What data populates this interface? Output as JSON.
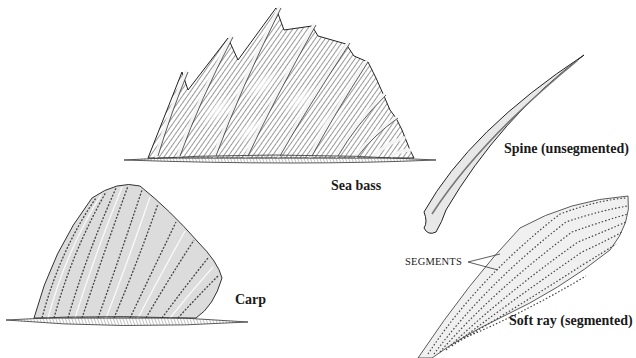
{
  "figure": {
    "colors": {
      "ink": "#1a1a1a",
      "shade": "#555555",
      "light": "#bdbdbd",
      "paper": "#ffffff"
    }
  },
  "illustrations": [
    {
      "id": "sea-bass-fin",
      "label": "Sea bass",
      "spine_count": 10
    },
    {
      "id": "carp-fin",
      "label": "Carp"
    },
    {
      "id": "spine",
      "label": "Spine (unsegmented)"
    },
    {
      "id": "soft-ray",
      "label": "Soft ray (segmented)",
      "callout": "SEGMENTS"
    }
  ],
  "labels": {
    "sea_bass": "Sea bass",
    "carp": "Carp",
    "spine": "Spine (unsegmented)",
    "soft_ray": "Soft ray (segmented)",
    "segments": "SEGMENTS"
  }
}
